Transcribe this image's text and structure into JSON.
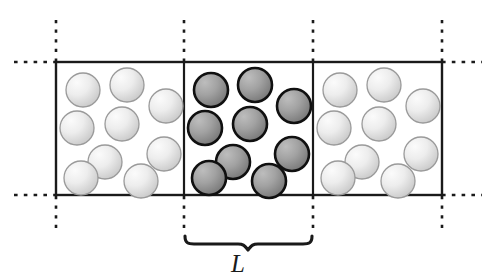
{
  "figure": {
    "background_color": "#ffffff"
  },
  "labels": {
    "box_length": "L",
    "box_length_x": 238,
    "box_length_y": 250
  },
  "geometry": {
    "box_left": 56,
    "box_right": 442,
    "box_top": 62,
    "box_bottom": 195,
    "divider_1_x": 184,
    "divider_2_x": 313,
    "cell_width": 129,
    "cell_height": 133
  },
  "colors": {
    "box_stroke": "#1a1a1a",
    "dash_stroke": "#1a1a1a",
    "brace_stroke": "#1a1a1a",
    "central_particle_fill_light": "#b4b4b4",
    "central_particle_fill_dark": "#7d7d7d",
    "central_particle_stroke": "#101010",
    "image_particle_fill_light": "#f0f0f0",
    "image_particle_fill_dark": "#c8c8c8",
    "image_particle_stroke": "#9a9a9a",
    "label_color": "#1a1a1a"
  },
  "cells": [
    {
      "name": "left-image-cell",
      "kind": "periodic-image",
      "x": 56,
      "particle_style": "light",
      "particle_count": 9
    },
    {
      "name": "central-cell",
      "kind": "simulation-box",
      "x": 184,
      "particle_style": "dark",
      "particle_count": 9
    },
    {
      "name": "right-image-cell",
      "kind": "periodic-image",
      "x": 313,
      "particle_style": "light",
      "particle_count": 9
    }
  ],
  "particle_layout": {
    "radius": 17,
    "positions": [
      {
        "cx": 27,
        "cy": 28
      },
      {
        "cx": 71,
        "cy": 23
      },
      {
        "cx": 110,
        "cy": 44
      },
      {
        "cx": 21,
        "cy": 66
      },
      {
        "cx": 66,
        "cy": 62
      },
      {
        "cx": 49,
        "cy": 100
      },
      {
        "cx": 108,
        "cy": 92
      },
      {
        "cx": 25,
        "cy": 116
      },
      {
        "cx": 85,
        "cy": 119
      }
    ]
  },
  "dashed_lines": {
    "vertical": [
      {
        "name": "dash-vertical-left",
        "x": 56,
        "top": 20,
        "upper_end": 62,
        "lower_start": 195,
        "bottom": 228
      },
      {
        "name": "dash-vertical-mid-left",
        "x": 184,
        "top": 20,
        "upper_end": 62,
        "lower_start": 195,
        "bottom": 228
      },
      {
        "name": "dash-vertical-mid-right",
        "x": 313,
        "top": 20,
        "upper_end": 62,
        "lower_start": 195,
        "bottom": 228
      },
      {
        "name": "dash-vertical-right",
        "x": 442,
        "top": 20,
        "upper_end": 62,
        "lower_start": 195,
        "bottom": 228
      }
    ],
    "horizontal": [
      {
        "name": "dash-horizontal-top-left",
        "y": 62,
        "x1": 14,
        "x2": 56
      },
      {
        "name": "dash-horizontal-top-right",
        "y": 62,
        "x1": 442,
        "x2": 480
      },
      {
        "name": "dash-horizontal-bottom-left",
        "y": 195,
        "x1": 14,
        "x2": 56
      },
      {
        "name": "dash-horizontal-bottom-right",
        "y": 195,
        "x1": 442,
        "x2": 480
      }
    ]
  },
  "brace": {
    "name": "length-brace",
    "x_start": 184,
    "x_end": 313,
    "y_top": 236,
    "y_tip": 249
  }
}
